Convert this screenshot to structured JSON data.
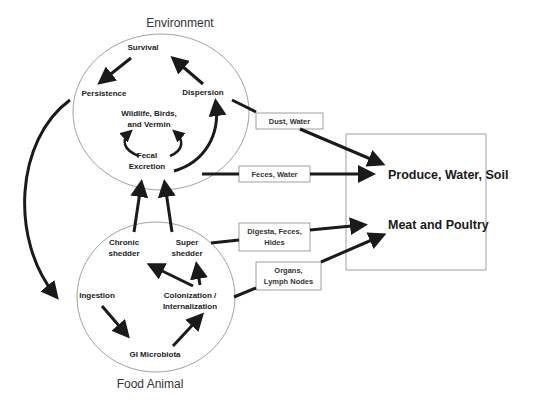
{
  "environment": {
    "title": "Environment",
    "nodes": {
      "survival": "Survival",
      "persistence": "Persistence",
      "dispersion": "Dispersion",
      "wildlife_1": "Wildlife, Birds,",
      "wildlife_2": "and Vermin",
      "fecal_1": "Fecal",
      "fecal_2": "Excretion"
    }
  },
  "food_animal": {
    "title": "Food Animal",
    "nodes": {
      "chronic_1": "Chronic",
      "chronic_2": "shedder",
      "super_1": "Super",
      "super_2": "shedder",
      "ingestion": "Ingestion",
      "colonization_1": "Colonization /",
      "colonization_2": "Internalization",
      "gi": "GI Microbiota"
    }
  },
  "pathways": {
    "dust_water": "Dust, Water",
    "feces_water": "Feces, Water",
    "digesta_1": "Digesta, Feces,",
    "digesta_2": "Hides",
    "organs_1": "Organs,",
    "organs_2": "Lymph Nodes"
  },
  "destinations": {
    "produce": "Produce, Water, Soil",
    "meat": "Meat and Poultry"
  }
}
